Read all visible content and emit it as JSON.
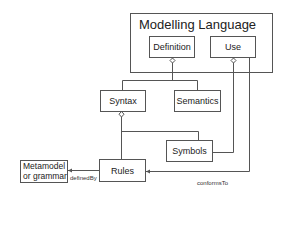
{
  "diagram": {
    "container": {
      "title": "Modelling Language"
    },
    "nodes": {
      "definition": "Definition",
      "use": "Use",
      "syntax": "Syntax",
      "semantics": "Semantics",
      "symbols": "Symbols",
      "rules": "Rules",
      "metamodel_line1": "Metamodel",
      "metamodel_line2": "or grammar"
    },
    "edges": {
      "defined_by": "definedBy",
      "conforms_to": "conformsTo"
    }
  },
  "colors": {
    "stroke": "#555555",
    "text": "#222222",
    "background": "#ffffff"
  }
}
